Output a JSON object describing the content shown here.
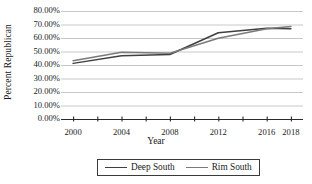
{
  "chart_data": {
    "type": "line",
    "title": "",
    "xlabel": "Year",
    "ylabel": "Percent Republican",
    "xlim": [
      1999,
      2019
    ],
    "ylim": [
      0,
      0.8
    ],
    "grid": true,
    "grid_axis": "y",
    "legend_position": "bottom",
    "x": [
      2000,
      2004,
      2008,
      2012,
      2016,
      2018
    ],
    "xticks_major": [
      "2000",
      "2004",
      "2008",
      "2012",
      "2016",
      "2018"
    ],
    "xticks_minor": [
      2002,
      2006,
      2010,
      2014
    ],
    "yticks": [
      "0.00%",
      "10.00%",
      "20.00%",
      "30.00%",
      "40.00%",
      "50.00%",
      "60.00%",
      "70.00%",
      "80.00%"
    ],
    "ytick_values": [
      0,
      0.1,
      0.2,
      0.3,
      0.4,
      0.5,
      0.6,
      0.7,
      0.8
    ],
    "series": [
      {
        "name": "Deep South",
        "color": "#3f3f3f",
        "values": [
          0.412,
          0.468,
          0.478,
          0.639,
          0.672,
          0.669
        ]
      },
      {
        "name": "Rim South",
        "color": "#7a7a7a",
        "values": [
          0.432,
          0.495,
          0.487,
          0.598,
          0.668,
          0.685
        ]
      }
    ]
  },
  "axes": {
    "y_title": "Percent Republican",
    "x_title": "Year"
  },
  "colors": {
    "gridline": "#c8c8c8",
    "axis": "#2b2b2b",
    "deep_south": "#3f3f3f",
    "rim_south": "#7a7a7a",
    "legend_border": "#3a3a3a",
    "background": "#ffffff"
  }
}
